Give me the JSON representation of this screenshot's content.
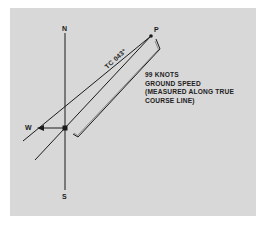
{
  "diagram": {
    "background_color": "#d8d8d8",
    "line_color": "#1a1a1a",
    "labels": {
      "north": "N",
      "south": "S",
      "wind": "W",
      "point": "P"
    },
    "course_label": "TC 043°",
    "annotation": {
      "line1": "99 KNOTS",
      "line2": "GROUND SPEED",
      "line3": "(MEASURED ALONG TRUE",
      "line4": "COURSE LINE)"
    },
    "elements": [
      {
        "name": "north-south-line",
        "from": [
          65,
          33
        ],
        "to": [
          65,
          190
        ]
      },
      {
        "name": "true-course-line",
        "from": [
          35,
          160
        ],
        "to": [
          151,
          36
        ]
      },
      {
        "name": "heading-line",
        "from": [
          23,
          141
        ],
        "to": [
          151,
          36
        ]
      },
      {
        "name": "wind-vector",
        "from": [
          65,
          128
        ],
        "to": [
          38,
          128
        ]
      },
      {
        "name": "ground-speed-bracket",
        "points": [
          [
            157,
            40
          ],
          [
            160,
            49
          ],
          [
            78,
            137
          ],
          [
            73,
            134
          ]
        ]
      }
    ]
  }
}
